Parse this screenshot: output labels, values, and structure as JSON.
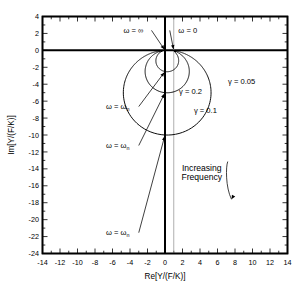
{
  "chart_data": {
    "type": "line",
    "title": "",
    "subtitle": "",
    "xlabel": "Re[Y/(F/K)]",
    "ylabel": "Im[Y/(F/K)]",
    "xlim": [
      -14,
      14
    ],
    "ylim": [
      -24,
      4
    ],
    "xticks": [
      -14,
      -12,
      -10,
      -8,
      -6,
      -4,
      -2,
      0,
      2,
      4,
      6,
      8,
      10,
      12,
      14
    ],
    "yticks": [
      4,
      2,
      0,
      -2,
      -4,
      -6,
      -8,
      -10,
      -12,
      -14,
      -16,
      -18,
      -20,
      -22,
      -24
    ],
    "xtick_labels": [
      "-14",
      "-12",
      "-10",
      "-8",
      "-6",
      "-4",
      "-2",
      "0",
      "2",
      "4",
      "6",
      "8",
      "10",
      "12",
      "14"
    ],
    "ytick_labels": [
      "4",
      "2",
      "0",
      "-2",
      "-4",
      "-6",
      "-8",
      "-10",
      "-12",
      "-14",
      "-16",
      "-18",
      "-20",
      "-22",
      "-24"
    ],
    "xtick_minor_step": 1,
    "ytick_minor_step": 1,
    "grid": false,
    "legend": "none",
    "reference_lines": [
      {
        "name": "real-axis",
        "orientation": "horizontal",
        "value": 0,
        "color": "#000000",
        "width": 2.0
      },
      {
        "name": "imaginary-axis",
        "orientation": "vertical",
        "value": 0,
        "color": "#000000",
        "width": 2.0
      },
      {
        "name": "static-deflection-asymptote",
        "orientation": "vertical",
        "value": 1,
        "color": "#9a9a9a",
        "width": 0.8
      }
    ],
    "series": [
      {
        "name": "gamma = 0.2",
        "label": "γ = 0.2",
        "damping_ratio": 0.2,
        "color": "#000000",
        "peak_imag": -2.5,
        "peak_point": [
          0,
          -2.5
        ],
        "start_point": [
          1,
          0
        ],
        "end_point": [
          0,
          0
        ],
        "min_real": -1.25,
        "max_real": 2.6,
        "label_pos": [
          1.6,
          -5.2
        ]
      },
      {
        "name": "gamma = 0.1",
        "label": "γ = 0.1",
        "damping_ratio": 0.1,
        "color": "#000000",
        "peak_imag": -5.0,
        "peak_point": [
          0,
          -5.0
        ],
        "start_point": [
          1,
          0
        ],
        "end_point": [
          0,
          0
        ],
        "min_real": -2.55,
        "max_real": 5.1,
        "label_pos": [
          3.3,
          -7.4
        ]
      },
      {
        "name": "gamma = 0.05",
        "label": "γ = 0.05",
        "damping_ratio": 0.05,
        "color": "#000000",
        "peak_imag": -10.0,
        "peak_point": [
          0,
          -10.0
        ],
        "start_point": [
          1,
          0
        ],
        "end_point": [
          0,
          0
        ],
        "min_real": -5.1,
        "max_real": 10.1,
        "label_pos": [
          7.2,
          -4.0
        ]
      }
    ],
    "annotations": [
      {
        "name": "omega-infinity",
        "text": "ω = ∞",
        "text_pos": [
          -3.6,
          2.1
        ],
        "target": [
          0,
          0
        ]
      },
      {
        "name": "omega-zero",
        "text": "ω = 0",
        "text_pos": [
          2.6,
          2.1
        ],
        "target": [
          1,
          0
        ]
      },
      {
        "name": "omega-n-gamma-02",
        "text": "ω = ω",
        "subscript": "n",
        "text_pos": [
          -5.4,
          -6.9
        ],
        "target": [
          0,
          -2.5
        ]
      },
      {
        "name": "omega-n-gamma-01",
        "text": "ω = ω",
        "subscript": "n",
        "text_pos": [
          -5.4,
          -11.5
        ],
        "target": [
          0,
          -5.0
        ]
      },
      {
        "name": "omega-n-gamma-005",
        "text": "ω = ω",
        "subscript": "n",
        "text_pos": [
          -5.4,
          -21.8
        ],
        "target": [
          0,
          -10.0
        ]
      },
      {
        "name": "increasing-frequency",
        "line1": "Increasing",
        "line2": "Frequency",
        "text_pos": [
          4.2,
          -14.2
        ],
        "target": [
          7.6,
          -17.6
        ]
      }
    ]
  }
}
